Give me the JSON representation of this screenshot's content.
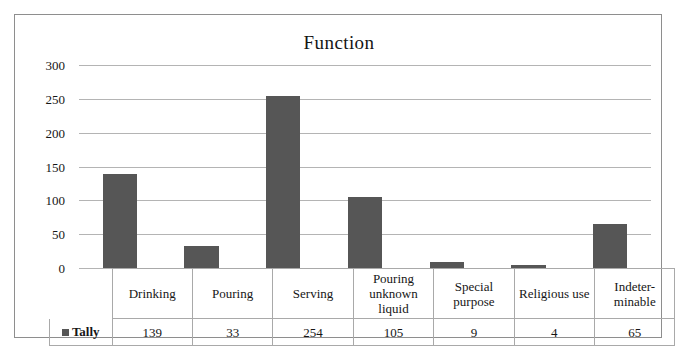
{
  "chart_data": {
    "type": "bar",
    "title": "Function",
    "xlabel": "",
    "ylabel": "",
    "ylim": [
      0,
      300
    ],
    "yticks": [
      300,
      250,
      200,
      150,
      100,
      50,
      0
    ],
    "grid": true,
    "legend_position": "bottom-left-table",
    "categories": [
      "Drinking",
      "Pouring",
      "Serving",
      "Pouring unknown liquid",
      "Special purpose",
      "Religious use",
      "Indeterminable"
    ],
    "series": [
      {
        "name": "Tally",
        "values": [
          139,
          33,
          254,
          105,
          9,
          4,
          65
        ],
        "color": "#565656"
      }
    ]
  },
  "table": {
    "legend_label": "Tally",
    "legend_swatch_color": "#565656",
    "category_cells": [
      "Drinking",
      "Pouring",
      "Serving",
      "Pouring\nunknown\nliquid",
      "Special\npurpose",
      "Religious use",
      "Indeter-\nminable"
    ],
    "value_cells": [
      "139",
      "33",
      "254",
      "105",
      "9",
      "4",
      "65"
    ]
  },
  "colors": {
    "bar": "#565656",
    "gridline": "#b4b4b4",
    "frame": "#8e8e8e",
    "table_border": "#a9a9a9",
    "background": "#ffffff",
    "text": "#161616"
  }
}
